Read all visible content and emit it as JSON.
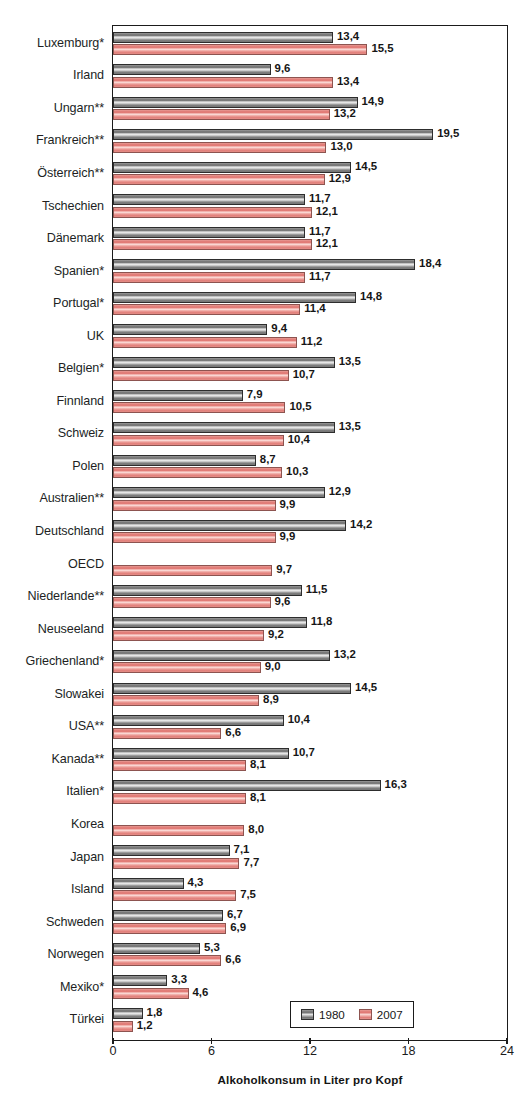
{
  "chart_data": {
    "type": "bar",
    "orientation": "horizontal",
    "title": "",
    "xlabel": "Alkoholkonsum in Liter pro Kopf",
    "ylabel": "",
    "xlim": [
      0,
      24
    ],
    "xticks": [
      0,
      6,
      12,
      18,
      24
    ],
    "xtick_labels": [
      "0",
      "6",
      "12",
      "18",
      "24"
    ],
    "grid": false,
    "legend_position": "bottom-right",
    "decimal_separator": ",",
    "categories": [
      "Luxemburg*",
      "Irland",
      "Ungarn**",
      "Frankreich**",
      "Österreich**",
      "Tschechien",
      "Dänemark",
      "Spanien*",
      "Portugal*",
      "UK",
      "Belgien*",
      "Finnland",
      "Schweiz",
      "Polen",
      "Australien**",
      "Deutschland",
      "OECD",
      "Niederlande**",
      "Neuseeland",
      "Griechenland*",
      "Slowakei",
      "USA**",
      "Kanada**",
      "Italien*",
      "Korea",
      "Japan",
      "Island",
      "Schweden",
      "Norwegen",
      "Mexiko*",
      "Türkei"
    ],
    "series": [
      {
        "name": "1980",
        "color": "#8b8b8b",
        "values": [
          13.4,
          9.6,
          14.9,
          19.5,
          14.5,
          11.7,
          11.7,
          18.4,
          14.8,
          9.4,
          13.5,
          7.9,
          13.5,
          8.7,
          12.9,
          14.2,
          null,
          11.5,
          11.8,
          13.2,
          14.5,
          10.4,
          10.7,
          16.3,
          null,
          7.1,
          4.3,
          6.7,
          5.3,
          3.3,
          1.8
        ],
        "value_labels": [
          "13,4",
          "9,6",
          "14,9",
          "19,5",
          "14,5",
          "11,7",
          "11,7",
          "18,4",
          "14,8",
          "9,4",
          "13,5",
          "7,9",
          "13,5",
          "8,7",
          "12,9",
          "14,2",
          "",
          "11,5",
          "11,8",
          "13,2",
          "14,5",
          "10,4",
          "10,7",
          "16,3",
          "",
          "7,1",
          "4,3",
          "6,7",
          "5,3",
          "3,3",
          "1,8"
        ]
      },
      {
        "name": "2007",
        "color": "#e88b85",
        "values": [
          15.5,
          13.4,
          13.2,
          13.0,
          12.9,
          12.1,
          12.1,
          11.7,
          11.4,
          11.2,
          10.7,
          10.5,
          10.4,
          10.3,
          9.9,
          9.9,
          9.7,
          9.6,
          9.2,
          9.0,
          8.9,
          6.6,
          8.1,
          8.1,
          8.0,
          7.7,
          7.5,
          6.9,
          6.6,
          4.6,
          1.2
        ],
        "value_labels": [
          "15,5",
          "13,4",
          "13,2",
          "13,0",
          "12,9",
          "12,1",
          "12,1",
          "11,7",
          "11,4",
          "11,2",
          "10,7",
          "10,5",
          "10,4",
          "10,3",
          "9,9",
          "9,9",
          "9,7",
          "9,6",
          "9,2",
          "9,0",
          "8,9",
          "6,6",
          "8,1",
          "8,1",
          "8,0",
          "7,7",
          "7,5",
          "6,9",
          "6,6",
          "4,6",
          "1,2"
        ]
      }
    ]
  },
  "legend": {
    "entries": [
      {
        "label": "1980",
        "swatch": "grey"
      },
      {
        "label": "2007",
        "swatch": "red"
      }
    ]
  },
  "colors": {
    "series_1980": "#8b8b8b",
    "series_2007": "#e88b85",
    "axis": "#1b1b1b",
    "text": "#221f1f",
    "background": "#ffffff"
  }
}
